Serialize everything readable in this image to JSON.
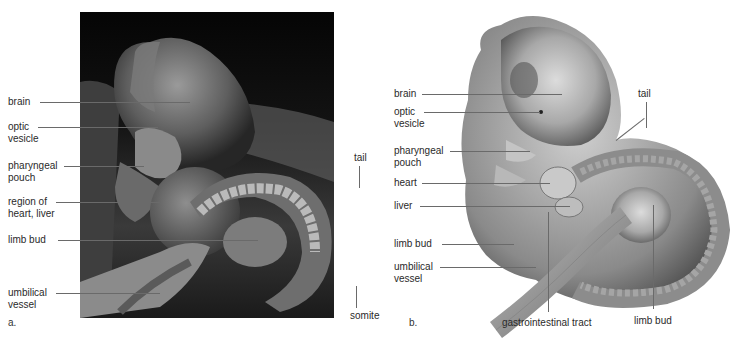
{
  "figure": {
    "panels": [
      {
        "id": "a",
        "letter": "a.",
        "type": "scanning-electron-micrograph",
        "labels": {
          "brain": "brain",
          "optic_vesicle_1": "optic",
          "optic_vesicle_2": "vesicle",
          "pharyngeal_pouch_1": "pharyngeal",
          "pharyngeal_pouch_2": "pouch",
          "heart_liver_1": "region of",
          "heart_liver_2": "heart, liver",
          "limb_bud": "limb bud",
          "umbilical_1": "umbilical",
          "umbilical_2": "vessel",
          "tail": "tail",
          "somite": "somite"
        }
      },
      {
        "id": "b",
        "letter": "b.",
        "type": "illustration",
        "labels": {
          "brain": "brain",
          "optic_vesicle_1": "optic",
          "optic_vesicle_2": "vesicle",
          "pharyngeal_pouch_1": "pharyngeal",
          "pharyngeal_pouch_2": "pouch",
          "heart": "heart",
          "liver": "liver",
          "limb_bud_upper": "limb bud",
          "umbilical_1": "umbilical",
          "umbilical_2": "vessel",
          "tail": "tail",
          "gi_tract": "gastrointestinal tract",
          "limb_bud_lower": "limb bud"
        }
      }
    ]
  }
}
